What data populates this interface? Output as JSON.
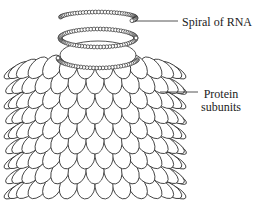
{
  "diagram": {
    "labels": {
      "rna": "Spiral of RNA",
      "protein_line1": "Protein",
      "protein_line2": "subunits"
    },
    "colors": {
      "stroke": "#2a2a2a",
      "fill": "#ffffff",
      "text": "#222222"
    }
  }
}
